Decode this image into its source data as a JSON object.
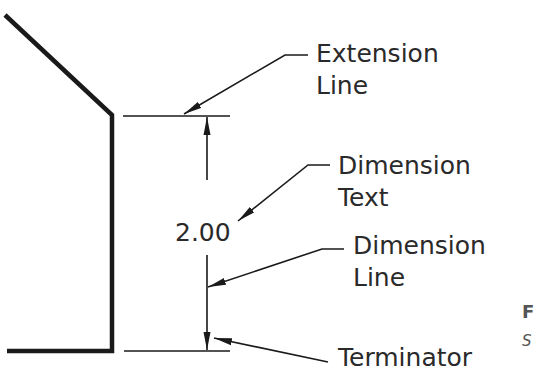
{
  "diagram": {
    "dimension_value": "2.00",
    "labels": {
      "extension": [
        "Extension",
        "Line"
      ],
      "dimension_text": [
        "Dimension",
        "Text"
      ],
      "dimension_line": [
        "Dimension",
        "Line"
      ],
      "terminator": [
        "Terminator"
      ]
    },
    "cutoff_text": [
      "F",
      "S"
    ],
    "colors": {
      "line": "#1a1a1a",
      "text": "#2a2a2a"
    }
  }
}
